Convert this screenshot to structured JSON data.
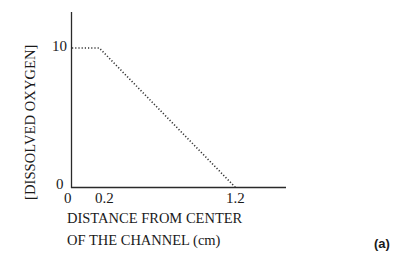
{
  "chart_data": {
    "type": "line",
    "title": "",
    "xlabel": "DISTANCE FROM CENTER OF THE CHANNEL (cm)",
    "xlabel_lines": [
      "DISTANCE FROM CENTER",
      "OF THE CHANNEL (cm)"
    ],
    "ylabel": "[DISSOLVED OXYGEN]",
    "x_ticks": [
      "0",
      "0.2",
      "1.2"
    ],
    "y_ticks": [
      "0",
      "10"
    ],
    "xlim": [
      0,
      1.5
    ],
    "ylim": [
      0,
      12
    ],
    "grid": false,
    "legend": null,
    "series": [
      {
        "name": "dissolved oxygen",
        "style": "dotted",
        "x": [
          0,
          0.2,
          1.2
        ],
        "y": [
          10,
          10,
          0
        ]
      }
    ],
    "panel_label": "(a)"
  }
}
